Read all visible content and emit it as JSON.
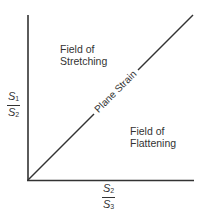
{
  "diagram": {
    "type": "strain-field plot",
    "y_axis_label": {
      "numerator": "S",
      "numerator_sub": "1",
      "denominator": "S",
      "denominator_sub": "2"
    },
    "x_axis_label": {
      "numerator": "S",
      "numerator_sub": "2",
      "denominator": "S",
      "denominator_sub": "3"
    },
    "diagonal_label": "Plane Strain",
    "upper_region": {
      "line1": "Field of",
      "line2": "Stretching"
    },
    "lower_region": {
      "line1": "Field of",
      "line2": "Flattening"
    },
    "colors": {
      "line": "#333333",
      "text": "#333333",
      "background": "#ffffff"
    }
  }
}
